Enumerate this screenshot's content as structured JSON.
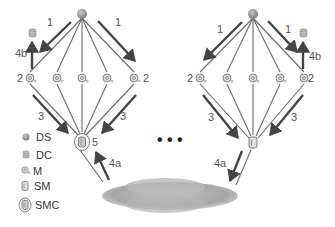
{
  "diagram": {
    "colors": {
      "ds": "#9a9a9a",
      "thin_line": "#6a6a6a",
      "thick_arrow": "#444444",
      "cloud": "#a8a8a8",
      "text": "#555555"
    },
    "clusters": [
      {
        "name": "left",
        "labels": {
          "step1_left": "1",
          "step1_right": "1",
          "step4b": "4b",
          "step2_left": "2",
          "step2_right": "2",
          "step3_left": "3",
          "step3_right": "3",
          "step5": "5",
          "step4a": "4a"
        },
        "bottom_node": "SMC",
        "dc_side": "left",
        "arrow_4a_direction": "up"
      },
      {
        "name": "right",
        "labels": {
          "step1_left": "1",
          "step1_right": "1",
          "step4b": "4b",
          "step2_left": "2",
          "step2_right": "2",
          "step3_left": "3",
          "step3_right": "3",
          "step4a": "4a"
        },
        "bottom_node": "SM",
        "dc_side": "right",
        "arrow_4a_direction": "down"
      }
    ],
    "ellipsis": "• • •",
    "legend": [
      {
        "icon": "ds-icon",
        "label": "DS"
      },
      {
        "icon": "dc-icon",
        "label": "DC"
      },
      {
        "icon": "m-icon",
        "label": "M"
      },
      {
        "icon": "sm-icon",
        "label": "SM"
      },
      {
        "icon": "smc-icon",
        "label": "SMC"
      }
    ]
  }
}
